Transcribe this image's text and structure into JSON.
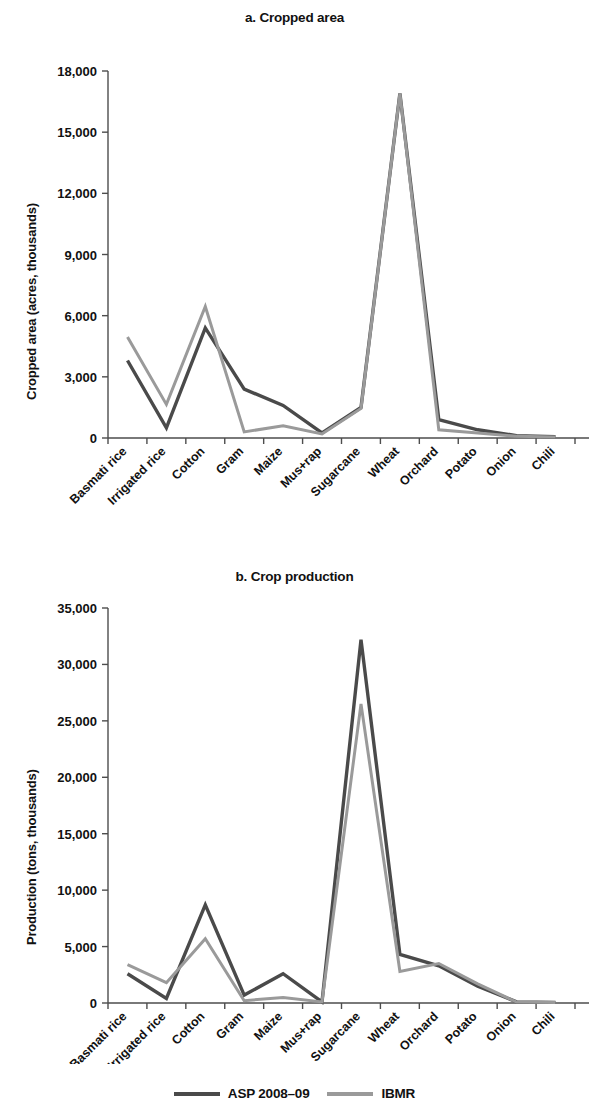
{
  "figure": {
    "legend": {
      "items": [
        {
          "label": "ASP 2008–09",
          "color": "#4a4a4a",
          "name": "asp-2008-09"
        },
        {
          "label": "IBMR",
          "color": "#9a9a9a",
          "name": "ibmr"
        }
      ]
    }
  },
  "chart_data": [
    {
      "type": "line",
      "title": "a. Cropped area",
      "xlabel": "",
      "ylabel": "Cropped area (acres, thousands)",
      "categories": [
        "Basmati rice",
        "Irrigated rice",
        "Cotton",
        "Gram",
        "Maize",
        "Mus+rap",
        "Sugarcane",
        "Wheat",
        "Orchard",
        "Potato",
        "Onion",
        "Chili"
      ],
      "ylim": [
        0,
        18000
      ],
      "yticks": [
        0,
        3000,
        6000,
        9000,
        12000,
        15000,
        18000
      ],
      "ytick_labels": [
        "0",
        "3,000",
        "6,000",
        "9,000",
        "12,000",
        "15,000",
        "18,000"
      ],
      "grid": false,
      "legend_position": "bottom",
      "series": [
        {
          "name": "ASP 2008–09",
          "color": "#4a4a4a",
          "values": [
            3800,
            500,
            5400,
            2400,
            1600,
            250,
            1500,
            16900,
            900,
            400,
            120,
            60
          ]
        },
        {
          "name": "IBMR",
          "color": "#9a9a9a",
          "values": [
            4950,
            1650,
            6450,
            300,
            600,
            200,
            1450,
            16900,
            400,
            250,
            90,
            50
          ]
        }
      ]
    },
    {
      "type": "line",
      "title": "b. Crop production",
      "xlabel": "",
      "ylabel": "Production (tons, thousands)",
      "categories": [
        "Basmati rice",
        "Irrigated rice",
        "Cotton",
        "Gram",
        "Maize",
        "Mus+rap",
        "Sugarcane",
        "Wheat",
        "Orchard",
        "Potato",
        "Onion",
        "Chili"
      ],
      "ylim": [
        0,
        35000
      ],
      "yticks": [
        0,
        5000,
        10000,
        15000,
        20000,
        25000,
        30000,
        35000
      ],
      "ytick_labels": [
        "0",
        "5,000",
        "10,000",
        "15,000",
        "20,000",
        "25,000",
        "30,000",
        "35,000"
      ],
      "grid": false,
      "legend_position": "bottom",
      "series": [
        {
          "name": "ASP 2008–09",
          "color": "#4a4a4a",
          "values": [
            2600,
            400,
            8700,
            700,
            2600,
            100,
            32200,
            4300,
            3300,
            1500,
            100,
            50
          ]
        },
        {
          "name": "IBMR",
          "color": "#9a9a9a",
          "values": [
            3400,
            1800,
            5700,
            200,
            500,
            100,
            26500,
            2800,
            3500,
            1700,
            80,
            40
          ]
        }
      ]
    }
  ]
}
